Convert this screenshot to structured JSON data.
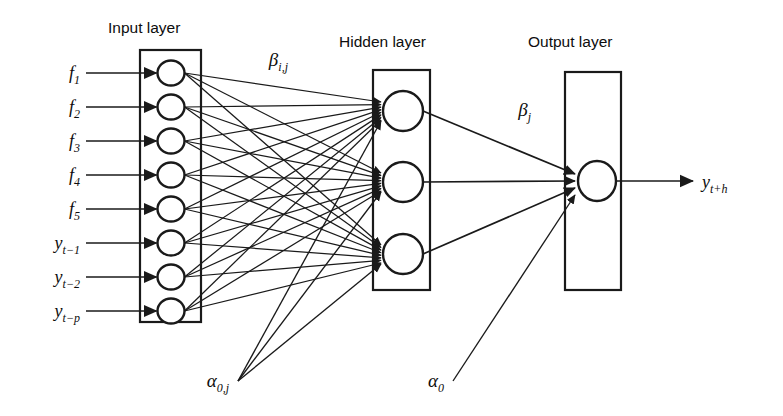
{
  "figure": {
    "type": "neural-network-diagram",
    "background_color": "#ffffff",
    "line_color": "#1a1a1a"
  },
  "titles": {
    "input": "Input layer",
    "hidden": "Hidden layer",
    "output": "Output layer"
  },
  "input_layer": {
    "node_count": 8,
    "labels": [
      {
        "base": "f",
        "sub": "1"
      },
      {
        "base": "f",
        "sub": "2"
      },
      {
        "base": "f",
        "sub": "3"
      },
      {
        "base": "f",
        "sub": "4"
      },
      {
        "base": "f",
        "sub": "5"
      },
      {
        "base": "y",
        "sub": "t−1"
      },
      {
        "base": "y",
        "sub": "t−2"
      },
      {
        "base": "y",
        "sub": "t−p"
      }
    ]
  },
  "hidden_layer": {
    "node_count": 3
  },
  "output_layer": {
    "node_count": 1,
    "label": {
      "base": "y",
      "sub": "t+h"
    }
  },
  "weights": {
    "input_to_hidden": {
      "base": "β",
      "sub": "i,j"
    },
    "hidden_to_output": {
      "base": "β",
      "sub": "j"
    },
    "hidden_bias": {
      "base": "α",
      "sub": "0,j"
    },
    "output_bias": {
      "base": "α",
      "sub": "0"
    }
  }
}
